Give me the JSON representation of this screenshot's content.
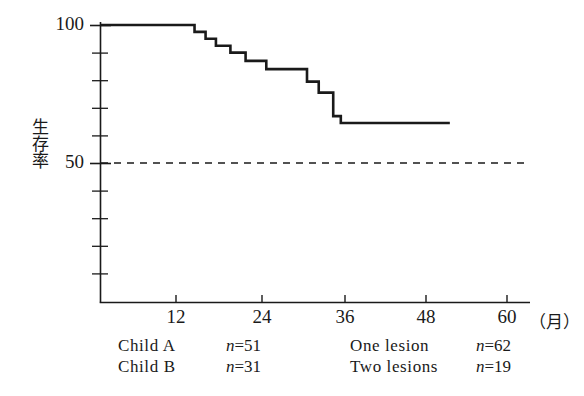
{
  "chart_data": {
    "type": "line",
    "subtype": "kaplan-meier-step",
    "title": "",
    "xlabel": "（月）",
    "ylabel": "生存率",
    "xlim": [
      1.3,
      61
    ],
    "ylim": [
      0,
      100
    ],
    "xticks": [
      12,
      24,
      36,
      48,
      60
    ],
    "xtick_labels": [
      "12",
      "24",
      "36",
      "48",
      "60"
    ],
    "yticks": [
      50,
      100
    ],
    "ytick_labels": [
      "50",
      "100"
    ],
    "y_minor_ticks": [
      10,
      20,
      30,
      40,
      60,
      70,
      80,
      90
    ],
    "grid": false,
    "legend_position": "below-axis",
    "reference_line": {
      "axis": "y",
      "value": 50,
      "style": "dashed",
      "color": "#1a1a1a"
    },
    "series": [
      {
        "name": "survival",
        "style": "step-post",
        "color": "#1a1a1a",
        "x": [
          1.3,
          15.0,
          15.0,
          16.6,
          16.6,
          18.1,
          18.1,
          20.2,
          20.2,
          22.4,
          22.4,
          25.4,
          25.4,
          31.3,
          31.3,
          33.0,
          33.0,
          35.1,
          35.1,
          36.2,
          36.2,
          52.0
        ],
        "y": [
          100,
          100,
          97.5,
          97.5,
          95.0,
          95.0,
          92.5,
          92.5,
          90.0,
          90.0,
          87.0,
          87.0,
          84.0,
          84.0,
          79.5,
          79.5,
          75.5,
          75.5,
          67.0,
          67.0,
          64.5,
          64.5
        ],
        "drop_points": [
          {
            "month": 15.0,
            "from": 100.0,
            "to": 97.5
          },
          {
            "month": 16.6,
            "from": 97.5,
            "to": 95.0
          },
          {
            "month": 18.1,
            "from": 95.0,
            "to": 92.5
          },
          {
            "month": 20.2,
            "from": 92.5,
            "to": 90.0
          },
          {
            "month": 22.4,
            "from": 90.0,
            "to": 87.0
          },
          {
            "month": 25.4,
            "from": 87.0,
            "to": 84.0
          },
          {
            "month": 31.3,
            "from": 84.0,
            "to": 79.5
          },
          {
            "month": 33.0,
            "from": 79.5,
            "to": 75.5
          },
          {
            "month": 35.1,
            "from": 75.5,
            "to": 67.0
          },
          {
            "month": 36.2,
            "from": 67.0,
            "to": 64.5
          }
        ],
        "plateau_value": 64.5,
        "plateau_start_month": 36.2,
        "end_month": 52.0
      }
    ],
    "annotations": [
      {
        "label": "Child A",
        "n": 51
      },
      {
        "label": "Child B",
        "n": 31
      },
      {
        "label": "One lesion",
        "n": 62
      },
      {
        "label": "Two lesions",
        "n": 19
      }
    ]
  },
  "axes": {
    "y_title": "生存率",
    "x_unit": "（月）",
    "y_tick_labels": [
      "100",
      "50"
    ],
    "x_tick_labels": [
      "12",
      "24",
      "36",
      "48",
      "60"
    ]
  },
  "legend": {
    "rows": [
      {
        "left": {
          "label": "Child A",
          "n_symbol": "n",
          "eq": "=",
          "n_value": "51"
        },
        "right": {
          "label": "One lesion",
          "n_symbol": "n",
          "eq": "=",
          "n_value": "62"
        }
      },
      {
        "left": {
          "label": "Child B",
          "n_symbol": "n",
          "eq": "=",
          "n_value": "31"
        },
        "right": {
          "label": "Two lesions",
          "n_symbol": "n",
          "eq": "=",
          "n_value": "19"
        }
      }
    ]
  },
  "colors": {
    "ink": "#1a1a1a",
    "background": "#ffffff",
    "curve": "#1a1a1a",
    "reference_line": "#1a1a1a"
  }
}
